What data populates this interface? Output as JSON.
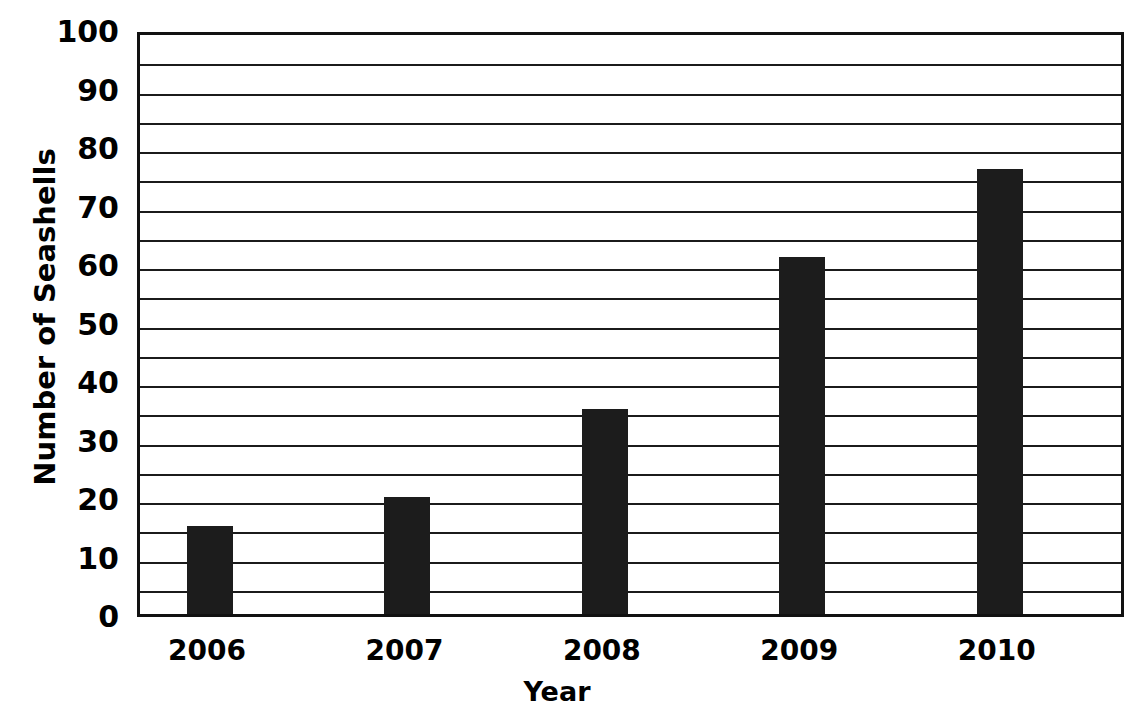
{
  "chart_data": {
    "type": "bar",
    "title": "",
    "categories": [
      "2006",
      "2007",
      "2008",
      "2009",
      "2010"
    ],
    "values": [
      15,
      20,
      35,
      61,
      76
    ],
    "xlabel": "Year",
    "ylabel": "Number of Seashells",
    "ylim": [
      0,
      100
    ],
    "ytick_labels": [
      "0",
      "10",
      "20",
      "30",
      "40",
      "50",
      "60",
      "70",
      "80",
      "90",
      "100"
    ],
    "ytick_values": [
      0,
      10,
      20,
      30,
      40,
      50,
      60,
      70,
      80,
      90,
      100
    ],
    "gridline_values": [
      5,
      10,
      15,
      20,
      25,
      30,
      35,
      40,
      45,
      50,
      55,
      60,
      65,
      70,
      75,
      80,
      85,
      90,
      95
    ],
    "grid": true,
    "legend": false,
    "bar_color": "#1c1c1c",
    "axis_color": "#111111",
    "background": "#ffffff"
  },
  "axes": {
    "y_title": "Number of Seashells",
    "x_title": "Year"
  }
}
